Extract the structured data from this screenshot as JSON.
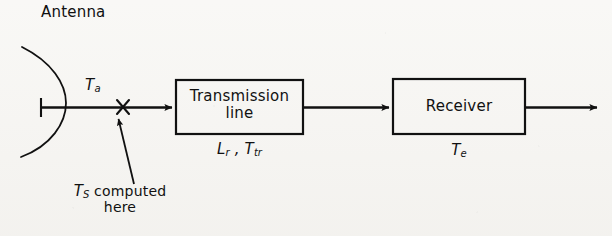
{
  "figure": {
    "kind": "block-diagram",
    "background_color": "#f7f6f3",
    "ink_color": "#111111"
  },
  "labels": {
    "antenna_title": "Antenna",
    "antenna_temperature": {
      "symbol": "T",
      "subscript": "a"
    },
    "system_note_line1_symbol": {
      "symbol": "T",
      "subscript": "S"
    },
    "system_note_line1_text": " computed",
    "system_note_line2_text": "here",
    "transmission_box_line1": "Transmission",
    "transmission_box_line2": "line",
    "transmission_loss": {
      "symbol": "L",
      "subscript": "r"
    },
    "transmission_temperature": {
      "symbol": "T",
      "subscript": "tr"
    },
    "transmission_params_separator": " , ",
    "receiver_box": "Receiver",
    "receiver_temperature": {
      "symbol": "T",
      "subscript": "e"
    }
  },
  "blocks": [
    {
      "name": "transmission-line",
      "x": 176,
      "y": 80,
      "w": 127,
      "h": 54
    },
    {
      "name": "receiver",
      "x": 393,
      "y": 79,
      "w": 132,
      "h": 55
    }
  ],
  "connections": [
    {
      "name": "antenna-to-transmission-line",
      "from_x": 40,
      "to_x": 176,
      "y": 107,
      "arrowhead": true
    },
    {
      "name": "transmission-line-to-receiver",
      "from_x": 303,
      "to_x": 393,
      "y": 107,
      "arrowhead": true
    },
    {
      "name": "receiver-output",
      "from_x": 525,
      "to_x": 601,
      "y": 107,
      "arrowhead": true
    }
  ],
  "markers": {
    "reference_plane_x": 123,
    "reference_plane_y": 107,
    "pointer_from_x": 134,
    "pointer_from_y": 184,
    "pointer_to_x": 118,
    "pointer_to_y": 117
  }
}
